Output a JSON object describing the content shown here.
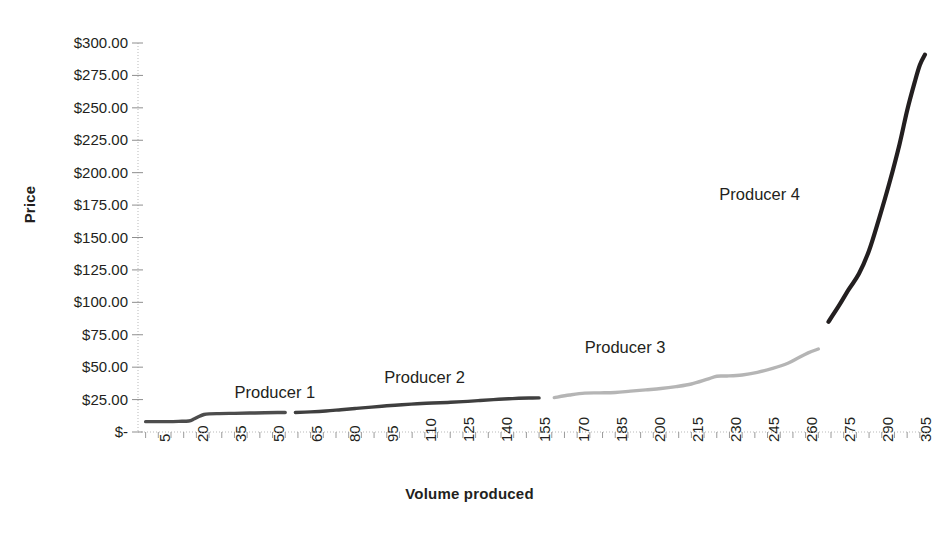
{
  "chart_data": {
    "type": "line",
    "title": "",
    "xlabel": "Volume produced",
    "ylabel": "Price",
    "xlim": [
      0,
      312
    ],
    "ylim": [
      0,
      300
    ],
    "grid": false,
    "legend_position": "inline-annotations",
    "y_tick_labels": [
      "$300.00",
      "$275.00",
      "$250.00",
      "$225.00",
      "$200.00",
      "$175.00",
      "$150.00",
      "$125.00",
      "$100.00",
      "$75.00",
      "$50.00",
      "$25.00",
      "$-"
    ],
    "y_tick_values": [
      300,
      275,
      250,
      225,
      200,
      175,
      150,
      125,
      100,
      75,
      50,
      25,
      0
    ],
    "x_tick_labels": [
      "5",
      "20",
      "35",
      "50",
      "65",
      "80",
      "95",
      "110",
      "125",
      "140",
      "155",
      "170",
      "185",
      "200",
      "215",
      "230",
      "245",
      "260",
      "275",
      "290",
      "305"
    ],
    "x_tick_values": [
      5,
      20,
      35,
      50,
      65,
      80,
      95,
      110,
      125,
      140,
      155,
      170,
      185,
      200,
      215,
      230,
      245,
      260,
      275,
      290,
      305
    ],
    "series": [
      {
        "name": "Producer 1",
        "color": "#4d4d4d",
        "label_x": 38,
        "label_y": 29,
        "x": [
          3,
          8,
          12,
          16,
          20,
          22,
          24,
          26,
          28,
          32,
          38,
          44,
          50,
          55,
          58
        ],
        "values": [
          8,
          8,
          8,
          8.2,
          8.5,
          10,
          12,
          13.5,
          14,
          14.2,
          14.4,
          14.6,
          14.8,
          15,
          15
        ]
      },
      {
        "name": "Producer 2",
        "color": "#3f3f3f",
        "label_x": 97,
        "label_y": 41,
        "x": [
          62,
          68,
          74,
          80,
          86,
          92,
          98,
          104,
          110,
          116,
          122,
          128,
          134,
          140,
          146,
          150,
          154,
          158
        ],
        "values": [
          15,
          15.5,
          16.2,
          17.2,
          18.2,
          19.2,
          20.2,
          21,
          21.8,
          22.4,
          22.8,
          23.4,
          24.2,
          25,
          25.6,
          26,
          26.2,
          26.3
        ]
      },
      {
        "name": "Producer 3",
        "color": "#b5b5b5",
        "label_x": 176,
        "label_y": 64,
        "x": [
          164,
          170,
          176,
          182,
          188,
          194,
          200,
          206,
          212,
          218,
          224,
          228,
          232,
          238,
          244,
          250,
          256,
          260,
          264,
          268
        ],
        "values": [
          26.5,
          28.5,
          30,
          30.2,
          30.5,
          31.5,
          32.5,
          33.5,
          35,
          37,
          40.5,
          43,
          43.2,
          44,
          46,
          49,
          53,
          57,
          61,
          64
        ]
      },
      {
        "name": "Producer 4",
        "color": "#231f20",
        "label_x": 229,
        "label_y": 182,
        "x": [
          272,
          276,
          280,
          284,
          288,
          292,
          296,
          300,
          303,
          306,
          308,
          310
        ],
        "values": [
          85,
          97,
          110,
          122,
          140,
          165,
          192,
          222,
          248,
          270,
          283,
          291
        ]
      }
    ]
  }
}
